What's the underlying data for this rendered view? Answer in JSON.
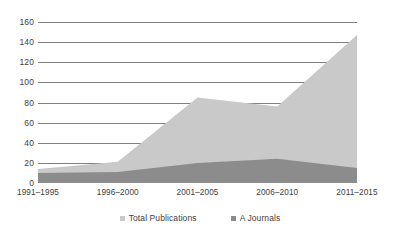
{
  "chart_data": {
    "type": "area",
    "title": "",
    "subtitle": "",
    "xlabel": "",
    "ylabel": "",
    "categories": [
      "1991–1995",
      "1996–2000",
      "2001–2005",
      "2006–2010",
      "2011–2015"
    ],
    "series": [
      {
        "name": "Total Publications",
        "color": "#c9c9c9",
        "values": [
          14,
          21,
          85,
          76,
          147
        ]
      },
      {
        "name": "A Journals",
        "color": "#8c8c8c",
        "values": [
          10,
          11,
          20,
          24,
          15
        ]
      }
    ],
    "ylim": [
      0,
      160
    ],
    "yticks": [
      0,
      20,
      40,
      60,
      80,
      100,
      120,
      140,
      160
    ],
    "ytick_labels": [
      "0",
      "20",
      "40",
      "60",
      "80",
      "100",
      "120",
      "140",
      "160"
    ],
    "grid": true,
    "grid_color": "#7f7f7f",
    "legend_position": "bottom",
    "stacked": false,
    "plot_background": "#ffffff"
  },
  "legend": {
    "items": [
      {
        "label": "Total Publications",
        "marker": "square-marker"
      },
      {
        "label": "A Journals",
        "marker": "square-marker"
      }
    ]
  }
}
